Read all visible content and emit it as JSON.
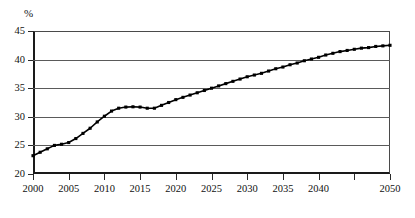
{
  "chart_data": {
    "type": "line",
    "title": "",
    "xlabel": "",
    "ylabel": "%",
    "y_unit_label": "%",
    "xlim": [
      2000,
      2050
    ],
    "ylim": [
      20,
      45
    ],
    "grid": true,
    "legend": "none",
    "marker": "filled-square",
    "line_color": "#000000",
    "grid_color": "#5a5a5a",
    "axis_color": "#1a1a1a",
    "y_ticks": [
      20,
      25,
      30,
      35,
      40,
      45
    ],
    "y_tick_labels": [
      "20",
      "25",
      "30",
      "35",
      "40",
      "45"
    ],
    "x_ticks": [
      2000,
      2005,
      2010,
      2015,
      2020,
      2025,
      2030,
      2035,
      2040,
      2045,
      2050
    ],
    "x_tick_labels": [
      "2000",
      "2005",
      "2010",
      "2015",
      "2020",
      "2025",
      "2030",
      "2035",
      "2040",
      "2050"
    ],
    "x_tick_labels_shown": [
      "2000",
      "2005",
      "2010",
      "2015",
      "2020",
      "2025",
      "2030",
      "2035",
      "2040",
      "2050"
    ],
    "x": [
      2000,
      2001,
      2002,
      2003,
      2004,
      2005,
      2006,
      2007,
      2008,
      2009,
      2010,
      2011,
      2012,
      2013,
      2014,
      2015,
      2016,
      2017,
      2018,
      2019,
      2020,
      2021,
      2022,
      2023,
      2024,
      2025,
      2026,
      2027,
      2028,
      2029,
      2030,
      2031,
      2032,
      2033,
      2034,
      2035,
      2036,
      2037,
      2038,
      2039,
      2040,
      2041,
      2042,
      2043,
      2044,
      2045,
      2046,
      2047,
      2048,
      2049,
      2050
    ],
    "values": [
      23.2,
      23.8,
      24.4,
      25.0,
      25.2,
      25.5,
      26.2,
      27.1,
      28.0,
      29.1,
      30.1,
      31.0,
      31.5,
      31.7,
      31.75,
      31.7,
      31.5,
      31.5,
      32.0,
      32.5,
      33.0,
      33.4,
      33.8,
      34.2,
      34.6,
      35.0,
      35.4,
      35.8,
      36.2,
      36.6,
      37.0,
      37.3,
      37.6,
      38.0,
      38.4,
      38.7,
      39.1,
      39.4,
      39.8,
      40.1,
      40.4,
      40.8,
      41.1,
      41.4,
      41.6,
      41.8,
      42.0,
      42.1,
      42.3,
      42.4,
      42.5
    ],
    "series": [
      {
        "name": "percentage",
        "values": [
          23.2,
          23.8,
          24.4,
          25.0,
          25.2,
          25.5,
          26.2,
          27.1,
          28.0,
          29.1,
          30.1,
          31.0,
          31.5,
          31.7,
          31.75,
          31.7,
          31.5,
          31.5,
          32.0,
          32.5,
          33.0,
          33.4,
          33.8,
          34.2,
          34.6,
          35.0,
          35.4,
          35.8,
          36.2,
          36.6,
          37.0,
          37.3,
          37.6,
          38.0,
          38.4,
          38.7,
          39.1,
          39.4,
          39.8,
          40.1,
          40.4,
          40.8,
          41.1,
          41.4,
          41.6,
          41.8,
          42.0,
          42.1,
          42.3,
          42.4,
          42.5
        ]
      }
    ]
  }
}
